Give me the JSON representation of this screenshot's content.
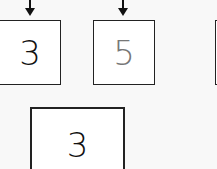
{
  "diagram": {
    "top_row": [
      {
        "value": "3",
        "color": "#111111"
      },
      {
        "value": "5",
        "color": "#777777"
      },
      {
        "value": "",
        "color": "#111111"
      }
    ],
    "bottom_row": [
      {
        "value": "3",
        "color": "#111111"
      }
    ],
    "arrows": 2
  }
}
